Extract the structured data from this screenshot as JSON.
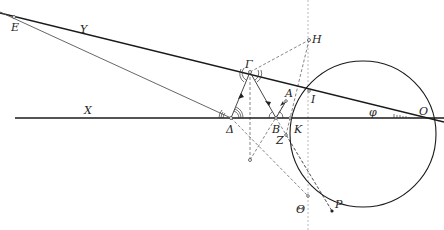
{
  "diagram": {
    "type": "geometric-optics-construction",
    "colors": {
      "line": "#1a1a1a",
      "thin": "#555555",
      "dashed": "#666666",
      "dotted": "#b0b0b0",
      "background": "#ffffff"
    },
    "labels": {
      "E": "Ε",
      "Y": "Υ",
      "X": "Χ",
      "Delta": "Δ",
      "Gamma": "Γ",
      "H": "Η",
      "A": "Α",
      "B": "Β",
      "I": "Ι",
      "K": "Κ",
      "Z": "Ζ",
      "O": "Ο",
      "phi": "φ",
      "Theta": "Θ",
      "P": "Ρ"
    },
    "points": {
      "E": [
        8,
        16
      ],
      "Delta": [
        231,
        118
      ],
      "Gamma": [
        250,
        72
      ],
      "H": [
        309,
        40
      ],
      "A": [
        286,
        101
      ],
      "B": [
        276,
        118
      ],
      "I": [
        309,
        91
      ],
      "K": [
        290,
        118
      ],
      "Z": [
        286,
        135
      ],
      "O": [
        428,
        118
      ],
      "Theta": [
        308,
        196
      ],
      "P": [
        332,
        211
      ],
      "L": [
        250,
        160
      ]
    },
    "circle": {
      "cx": 363,
      "cy": 134,
      "r": 73
    }
  }
}
